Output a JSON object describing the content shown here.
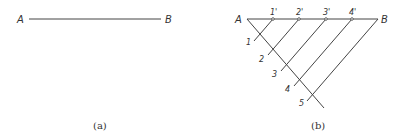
{
  "figure_a": {
    "caption": "(a)",
    "label_start": "A",
    "label_end": "B"
  },
  "figure_b": {
    "caption": "(b)",
    "label_start": "A",
    "label_end": "B",
    "top_points": [
      "1'",
      "2'",
      "3'",
      "4'"
    ],
    "diagonal_points": [
      "1",
      "2",
      "3",
      "4",
      "5"
    ]
  },
  "colors": {
    "line": "#444444",
    "text": "#333333",
    "background": "#ffffff"
  }
}
